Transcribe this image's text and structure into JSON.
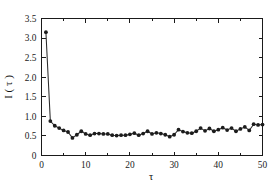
{
  "figure": {
    "background_color": "#ffffff",
    "foreground_color": "#1a1a1a",
    "marker_color": "#1c1c1c",
    "line_color": "#2b2b2b"
  },
  "chart_data": {
    "type": "line",
    "title": "",
    "subtitle": "",
    "xlabel": "τ",
    "ylabel": "I ( τ )",
    "xlim": [
      0,
      50
    ],
    "ylim": [
      0,
      3.5
    ],
    "grid": false,
    "legend": null,
    "legend_position": "none",
    "markers": "filled-circle",
    "xticks": [
      0,
      10,
      20,
      30,
      40,
      50
    ],
    "xticklabels": [
      "0",
      "10",
      "20",
      "30",
      "40",
      "50"
    ],
    "yticks": [
      0,
      0.5,
      1.0,
      1.5,
      2.0,
      2.5,
      3.0,
      3.5
    ],
    "yticklabels": [
      "0",
      "0.5",
      "1.0",
      "1.5",
      "2.0",
      "2.5",
      "3.0",
      "3.5"
    ],
    "x": [
      1,
      2,
      3,
      4,
      5,
      6,
      7,
      8,
      9,
      10,
      11,
      12,
      13,
      14,
      15,
      16,
      17,
      18,
      19,
      20,
      21,
      22,
      23,
      24,
      25,
      26,
      27,
      28,
      29,
      30,
      31,
      32,
      33,
      34,
      35,
      36,
      37,
      38,
      39,
      40,
      41,
      42,
      43,
      44,
      45,
      46,
      47,
      48,
      49,
      50
    ],
    "values": [
      3.15,
      0.88,
      0.76,
      0.7,
      0.64,
      0.6,
      0.45,
      0.53,
      0.62,
      0.55,
      0.52,
      0.56,
      0.56,
      0.55,
      0.55,
      0.52,
      0.51,
      0.52,
      0.52,
      0.54,
      0.57,
      0.52,
      0.56,
      0.62,
      0.55,
      0.58,
      0.56,
      0.53,
      0.48,
      0.53,
      0.66,
      0.61,
      0.58,
      0.57,
      0.62,
      0.7,
      0.63,
      0.69,
      0.62,
      0.66,
      0.71,
      0.65,
      0.7,
      0.62,
      0.68,
      0.73,
      0.64,
      0.8,
      0.78,
      0.79
    ],
    "series": [
      {
        "name": "I(τ)",
        "values": [
          3.15,
          0.88,
          0.76,
          0.7,
          0.64,
          0.6,
          0.45,
          0.53,
          0.62,
          0.55,
          0.52,
          0.56,
          0.56,
          0.55,
          0.55,
          0.52,
          0.51,
          0.52,
          0.52,
          0.54,
          0.57,
          0.52,
          0.56,
          0.62,
          0.55,
          0.58,
          0.56,
          0.53,
          0.48,
          0.53,
          0.66,
          0.61,
          0.58,
          0.57,
          0.62,
          0.7,
          0.63,
          0.69,
          0.62,
          0.66,
          0.71,
          0.65,
          0.7,
          0.62,
          0.68,
          0.73,
          0.64,
          0.8,
          0.78,
          0.79
        ]
      }
    ]
  }
}
